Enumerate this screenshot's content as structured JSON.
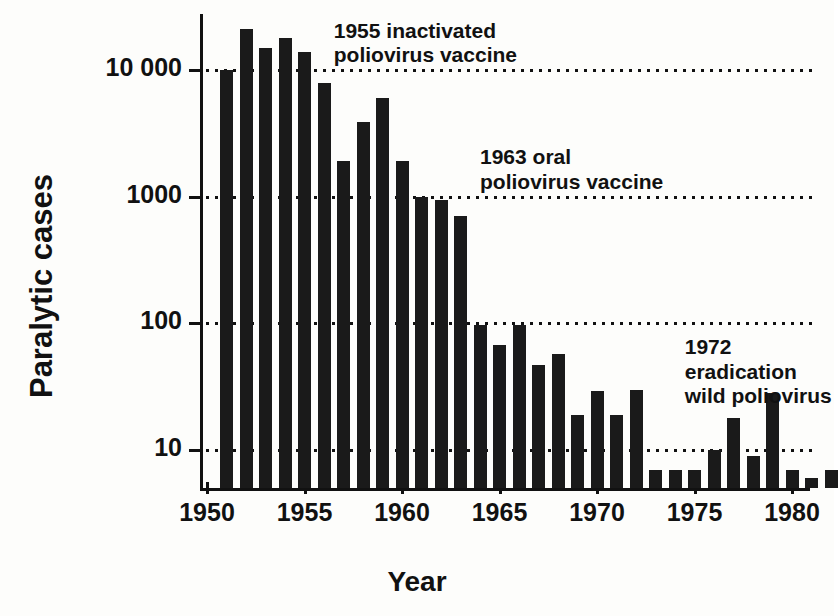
{
  "chart_data": {
    "type": "bar",
    "title": "",
    "xlabel": "Year",
    "ylabel": "Paralytic cases",
    "yscale": "log",
    "ylim": [
      5,
      30000
    ],
    "ytick_labels": [
      "10 000",
      "1000",
      "100",
      "10"
    ],
    "ytick_values": [
      10000,
      1000,
      100,
      10
    ],
    "xtick_labels": [
      "1950",
      "1955",
      "1960",
      "1965",
      "1970",
      "1975",
      "1980"
    ],
    "xtick_values": [
      1950,
      1955,
      1960,
      1965,
      1970,
      1975,
      1980
    ],
    "grid": "horizontal dotted at 10000, 1000, 100, 10",
    "legend": "none",
    "bar_color": "#1a1a1a",
    "x": [
      1951,
      1952,
      1953,
      1954,
      1955,
      1956,
      1957,
      1958,
      1959,
      1960,
      1961,
      1962,
      1963,
      1964,
      1965,
      1966,
      1967,
      1968,
      1969,
      1970,
      1971,
      1972,
      1973,
      1974,
      1975,
      1976,
      1977,
      1978,
      1979,
      1980,
      1981,
      1982
    ],
    "categories": [
      "1951",
      "1952",
      "1953",
      "1954",
      "1955",
      "1956",
      "1957",
      "1958",
      "1959",
      "1960",
      "1961",
      "1962",
      "1963",
      "1964",
      "1965",
      "1966",
      "1967",
      "1968",
      "1969",
      "1970",
      "1971",
      "1972",
      "1973",
      "1974",
      "1975",
      "1976",
      "1977",
      "1978",
      "1979",
      "1980",
      "1981",
      "1982"
    ],
    "values": [
      10000,
      21000,
      15000,
      18000,
      13800,
      7900,
      1900,
      3900,
      6000,
      1900,
      1000,
      940,
      700,
      97,
      67,
      97,
      47,
      57,
      19,
      29,
      19,
      30,
      7,
      7,
      7,
      10,
      18,
      9,
      28,
      7,
      6,
      7
    ],
    "annotations": [
      {
        "text": "1955 inactivated\npoliovirus vaccine",
        "x": 1956.5,
        "y": 22000
      },
      {
        "text": "1963 oral\npoliovirus vaccine",
        "x": 1964.0,
        "y": 2200
      },
      {
        "text": "1972 eradication\nwild poliovirus",
        "x": 1974.5,
        "y": 70
      }
    ]
  },
  "axes": {
    "y_title": "Paralytic cases",
    "x_title": "Year",
    "y_ticks": [
      {
        "label": "10 000",
        "value": 10000
      },
      {
        "label": "1000",
        "value": 1000
      },
      {
        "label": "100",
        "value": 100
      },
      {
        "label": "10",
        "value": 10
      }
    ],
    "x_ticks": [
      {
        "label": "1950",
        "value": 1950
      },
      {
        "label": "1955",
        "value": 1955
      },
      {
        "label": "1960",
        "value": 1960
      },
      {
        "label": "1965",
        "value": 1965
      },
      {
        "label": "1970",
        "value": 1970
      },
      {
        "label": "1975",
        "value": 1975
      },
      {
        "label": "1980",
        "value": 1980
      }
    ]
  },
  "annotations": {
    "a1": "1955 inactivated\npoliovirus vaccine",
    "a2": "1963 oral\npoliovirus vaccine",
    "a3": "1972 eradication\nwild poliovirus"
  },
  "colors": {
    "bar": "#1a1a1a",
    "axis": "#111111",
    "background": "#fdfdfb"
  }
}
